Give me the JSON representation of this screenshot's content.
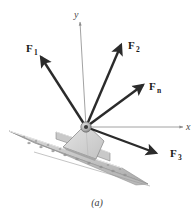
{
  "figure": {
    "caption": "(a)",
    "caption_label": "(a)"
  },
  "axes": {
    "x_label": "x",
    "y_label": "y",
    "origin_label": "O",
    "axis_color": "#8a8a8a"
  },
  "vectors": [
    {
      "id": "F1",
      "label": "F",
      "subscript": "1",
      "label_x": 26,
      "label_y": 52,
      "sub_x": 34,
      "sub_y": 55,
      "tail_x": 86,
      "tail_y": 127,
      "tip_x": 41,
      "tip_y": 57
    },
    {
      "id": "F2",
      "label": "F",
      "subscript": "2",
      "label_x": 128,
      "label_y": 49,
      "sub_x": 136,
      "sub_y": 52,
      "tail_x": 86,
      "tail_y": 127,
      "tip_x": 121,
      "tip_y": 45
    },
    {
      "id": "Fn",
      "label": "F",
      "subscript": "n",
      "label_x": 149,
      "label_y": 90,
      "sub_x": 157,
      "sub_y": 93,
      "tail_x": 86,
      "tail_y": 127,
      "tip_x": 143,
      "tip_y": 85
    },
    {
      "id": "F3",
      "label": "F",
      "subscript": "3",
      "label_x": 170,
      "label_y": 157,
      "sub_x": 178,
      "sub_y": 160,
      "tail_x": 86,
      "tail_y": 127,
      "tip_x": 156,
      "tip_y": 153
    }
  ],
  "colors": {
    "vector": "#2b2b2b",
    "axis": "#8a8a8a",
    "plate_fill": "#d6d6d6",
    "plate_edge": "#8f8f8f",
    "beam_top": "#cfcfcf",
    "beam_face": "#b6b6b6",
    "beam_edge": "#7d7d7d",
    "hub": "#9a9a9a",
    "background": "#ffffff"
  }
}
